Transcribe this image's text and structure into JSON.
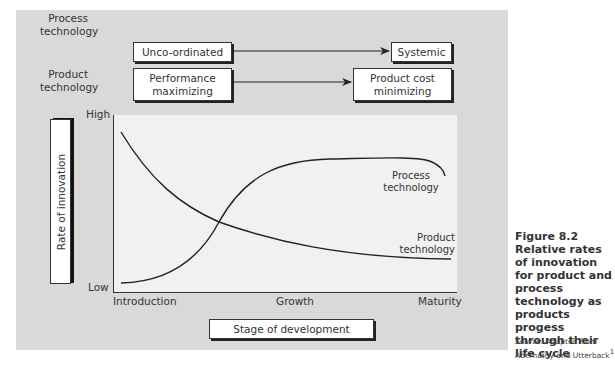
{
  "header_rows": [
    {
      "label_line1": "Process",
      "label_line2": "technology",
      "from": "Unco-ordinated",
      "to": "Systemic"
    },
    {
      "label_line1": "Product",
      "label_line2": "technology",
      "from_line1": "Performance",
      "from_line2": "maximizing",
      "to_line1": "Product cost",
      "to_line2": "minimizing"
    }
  ],
  "axes": {
    "y_label": "Rate of innovation",
    "y_high": "High",
    "y_low": "Low",
    "x_label": "Stage of development",
    "x_ticks": [
      "Introduction",
      "Growth",
      "Maturity"
    ]
  },
  "curves": {
    "process": {
      "label_line1": "Process",
      "label_line2": "technology"
    },
    "product": {
      "label_line1": "Product",
      "label_line2": "technology"
    }
  },
  "caption": {
    "figure": "Figure 8.2",
    "title": "Relative rates of innovation for product and process technology as products progess through their life cycle",
    "source_prefix": "Source:",
    "source_text": "Adapted from Abernathy and Utterback",
    "source_ref": "1"
  },
  "colors": {
    "panel": "#d9d9d9",
    "plot": "#f1f1f1",
    "line": "#222222"
  }
}
